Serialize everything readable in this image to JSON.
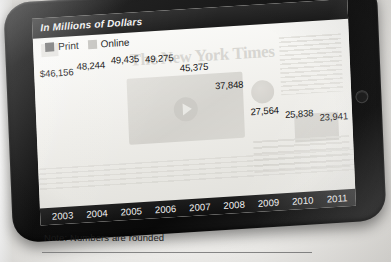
{
  "chart_data": {
    "type": "bar",
    "subtype": "stacked",
    "title": "In Millions of Dollars",
    "xlabel": "",
    "ylabel": "",
    "grid": false,
    "legend_position": "top-left",
    "categories": [
      "2003",
      "2004",
      "2005",
      "2006",
      "2007",
      "2008",
      "2009",
      "2010",
      "2011"
    ],
    "total_labels": [
      "$46,156",
      "48,244",
      "49,435",
      "49,275",
      "45,375",
      "37,848",
      "27,564",
      "25,838",
      "23,941"
    ],
    "totals": [
      46156,
      48244,
      49435,
      49275,
      45375,
      37848,
      27564,
      25838,
      23941
    ],
    "series": [
      {
        "name": "Print",
        "color": "#6d6d6d",
        "values": [
          46156,
          48244,
          49435,
          48775,
          44575,
          36648,
          26164,
          24238,
          21341
        ]
      },
      {
        "name": "Online",
        "color": "#c6c5c1",
        "values": [
          0,
          0,
          0,
          500,
          800,
          1200,
          1400,
          1600,
          2600
        ]
      }
    ],
    "ylim": [
      0,
      52000
    ],
    "note": "Note: Numbers are rounded"
  },
  "device": {
    "name": "tablet",
    "home_button": "home-button"
  },
  "chart": {
    "title": "In Millions of Dollars",
    "legend": [
      {
        "label": "Print",
        "swatch": "print-swatch"
      },
      {
        "label": "Online",
        "swatch": "online-swatch"
      }
    ],
    "bars": [
      {
        "year": "2003",
        "label": "$46,156",
        "print_h": 74.5,
        "online_h": 0.0
      },
      {
        "year": "2004",
        "label": "48,244",
        "print_h": 77.9,
        "online_h": 0.0
      },
      {
        "year": "2005",
        "label": "49,435",
        "print_h": 79.8,
        "online_h": 0.0
      },
      {
        "year": "2006",
        "label": "49,275",
        "print_h": 78.7,
        "online_h": 0.8
      },
      {
        "year": "2007",
        "label": "45,375",
        "print_h": 71.9,
        "online_h": 1.3
      },
      {
        "year": "2008",
        "label": "37,848",
        "print_h": 59.1,
        "online_h": 1.9
      },
      {
        "year": "2009",
        "label": "27,564",
        "print_h": 42.2,
        "online_h": 2.3
      },
      {
        "year": "2010",
        "label": "25,838",
        "print_h": 39.1,
        "online_h": 2.6
      },
      {
        "year": "2011",
        "label": "23,941",
        "print_h": 34.4,
        "online_h": 4.2
      }
    ]
  },
  "watermark": {
    "masthead": "The New York Times"
  },
  "footer": {
    "note": "Note: Numbers are rounded"
  }
}
